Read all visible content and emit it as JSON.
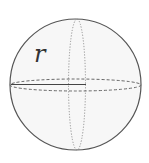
{
  "diagram": {
    "radius_label": "r",
    "colors": {
      "outline": "#555555",
      "fill": "#f7f7f7",
      "dashed": "#666666",
      "dotted": "#888888",
      "radius_line": "#444444"
    }
  }
}
